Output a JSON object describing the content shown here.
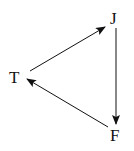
{
  "diagram": {
    "type": "directed-cycle",
    "nodes": [
      {
        "id": "T",
        "label": "T"
      },
      {
        "id": "J",
        "label": "J"
      },
      {
        "id": "F",
        "label": "F"
      }
    ],
    "edges": [
      {
        "from": "T",
        "to": "J"
      },
      {
        "from": "J",
        "to": "F"
      },
      {
        "from": "F",
        "to": "T"
      }
    ],
    "colors": {
      "stroke": "#111111",
      "background": "#ffffff"
    }
  }
}
